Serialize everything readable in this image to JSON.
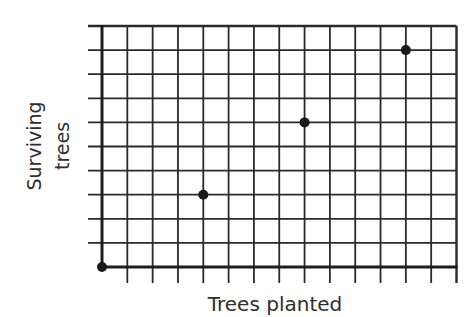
{
  "chart_data": {
    "type": "scatter",
    "title": "",
    "xlabel": "Trees planted",
    "ylabel": [
      "Surviving",
      "trees"
    ],
    "x_grid_count": 14,
    "y_grid_count": 10,
    "xlim": [
      0,
      14
    ],
    "ylim": [
      0,
      10
    ],
    "grid": true,
    "tick_labels_shown": false,
    "legend": null,
    "points": [
      {
        "x": 0,
        "y": 0
      },
      {
        "x": 4,
        "y": 3
      },
      {
        "x": 8,
        "y": 6
      },
      {
        "x": 12,
        "y": 9
      }
    ]
  },
  "style": {
    "grid_color": "#2a2a2a",
    "axis_color": "#1e1e1e",
    "point_color": "#1a1a1a",
    "text_color": "#2e2e2e"
  },
  "layout": {
    "plot_left": 102,
    "plot_right": 456.5,
    "plot_top": 26,
    "plot_bottom": 267,
    "tick_left_extent": 88,
    "tick_bottom_extent": 283,
    "point_radius": 5
  }
}
